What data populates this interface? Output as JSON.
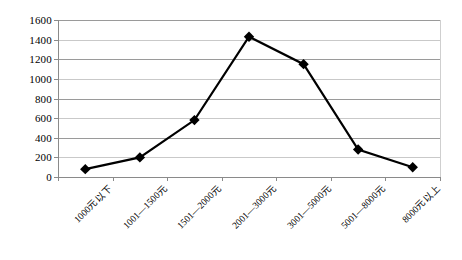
{
  "chart_data": {
    "type": "line",
    "title": "",
    "subtitle": "",
    "xlabel": "",
    "ylabel": "",
    "categories": [
      "1000元以下",
      "1001—1500元",
      "1501—2000元",
      "2001—3000元",
      "3001—5000元",
      "5001—8000元",
      "8000元以上"
    ],
    "values": [
      80,
      200,
      580,
      1430,
      1150,
      280,
      100
    ],
    "series": [
      {
        "name": "",
        "values": [
          80,
          200,
          580,
          1430,
          1150,
          280,
          100
        ]
      }
    ],
    "ylim": [
      0,
      1600
    ],
    "ytick_labels": [
      "0",
      "200",
      "400",
      "600",
      "800",
      "1000",
      "1200",
      "1400",
      "1600"
    ],
    "ytick_values": [
      0,
      200,
      400,
      600,
      800,
      1000,
      1200,
      1400,
      1600
    ],
    "grid": true,
    "legend": "none",
    "marker": "diamond",
    "line_color": "#000000",
    "marker_color": "#000000",
    "grid_color": "#9a9a9a",
    "axis_color": "#8a8a8a",
    "background_color": "#ffffff"
  }
}
